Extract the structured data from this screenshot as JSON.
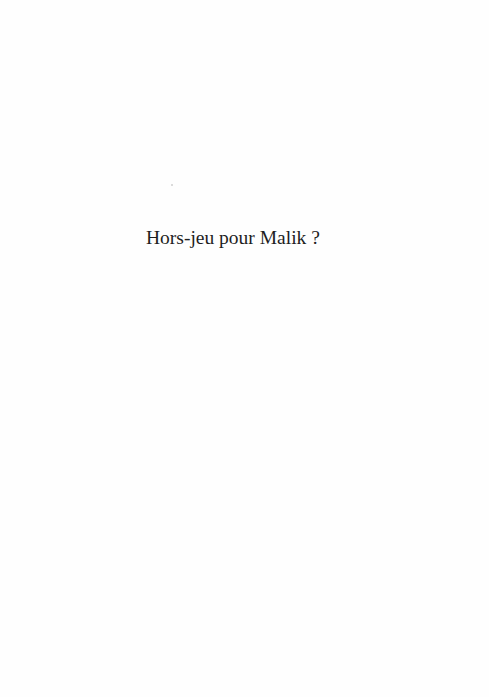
{
  "page": {
    "title": "Hors-jeu pour Malik ?"
  }
}
